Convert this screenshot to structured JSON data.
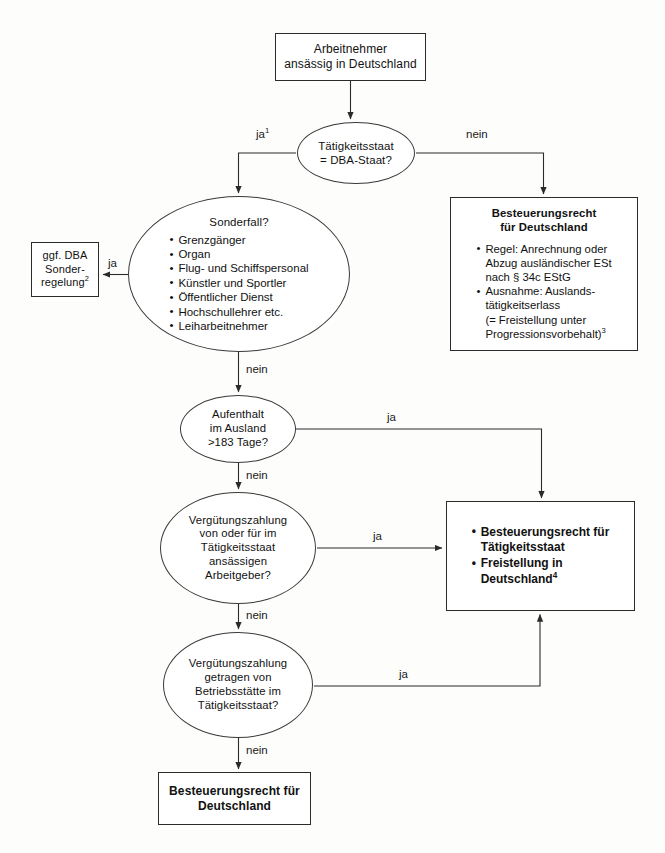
{
  "diagram": {
    "nodes": {
      "employee": {
        "lines": [
          "Arbeitnehmer",
          "ansässig in Deutschland"
        ]
      },
      "dba_state": {
        "lines": [
          "Tätigkeitsstaat",
          "= DBA-Staat?"
        ]
      },
      "special_case": {
        "header": "Sonderfall?",
        "items": [
          "Grenzgänger",
          "Organ",
          "Flug- und Schiffspersonal",
          "Künstler und Sportler",
          "Öffentlicher Dienst",
          "Hochschullehrer etc.",
          "Leiharbeitnehmer"
        ]
      },
      "dba_special_rule": {
        "lines": [
          "ggf. DBA",
          "Sonder-",
          "regelung"
        ],
        "footnote": "2"
      },
      "taxing_right_germany": {
        "header_lines": [
          "Besteuerungsrecht",
          "für Deutschland"
        ],
        "items": [
          "Regel: Anrechnung oder Abzug ausländischer ESt nach § 34c EStG",
          "Ausnahme: Auslands-tätigkeitserlass (= Freistellung unter Progressionsvorbehalt)"
        ],
        "item_lines": [
          [
            "Regel: Anrechnung oder",
            "Abzug ausländischer ESt",
            "nach § 34c EStG"
          ],
          [
            "Ausnahme: Auslands-",
            "tätigkeitserlass",
            "(= Freistellung unter",
            "Progressionsvorbehalt)"
          ]
        ],
        "footnote": "3"
      },
      "stay_abroad": {
        "lines": [
          "Aufenthalt",
          "im Ausland",
          ">183 Tage?"
        ]
      },
      "employer_payment": {
        "lines": [
          "Vergütungszahlung",
          "von oder für im",
          "Tätigkeitsstaat",
          "ansässigen",
          "Arbeitgeber?"
        ]
      },
      "permanent_establishment": {
        "lines": [
          "Vergütungszahlung",
          "getragen von",
          "Betriebsstätte im",
          "Tätigkeitsstaat?"
        ]
      },
      "taxing_right_state": {
        "item_lines": [
          [
            "Besteuerungsrecht für",
            "Tätigkeitsstaat"
          ],
          [
            "Freistellung in",
            "Deutschland"
          ]
        ],
        "footnote": "4"
      },
      "final_germany": {
        "lines": [
          "Besteuerungsrecht für",
          "Deutschland"
        ]
      }
    },
    "edge_labels": {
      "ja1": "ja",
      "ja1_footnote": "1",
      "nein1": "nein",
      "ja_special": "ja",
      "nein_special": "nein",
      "ja_days": "ja",
      "nein_days": "nein",
      "ja_employer": "ja",
      "nein_employer": "nein",
      "ja_pe": "ja",
      "nein_pe": "nein"
    },
    "colors": {
      "line": "#2b2b2b",
      "text": "#111111",
      "background": "#fdfdfc"
    }
  }
}
